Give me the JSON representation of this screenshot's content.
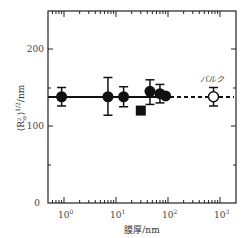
{
  "chart_data": {
    "type": "scatter",
    "title": "",
    "xlabel": "膜厚/nm",
    "ylabel": "⟨R²_zy⟩^(1/2)/nm",
    "xscale": "log",
    "xlim": [
      0.5,
      1800
    ],
    "ylim": [
      0,
      250
    ],
    "x_ticks": [
      "10^0",
      "10^1",
      "10^2",
      "10^3"
    ],
    "y_ticks": [
      "0",
      "100",
      "200"
    ],
    "grid": false,
    "series": [
      {
        "name": "thin films (circles)",
        "marker": "filled-circle",
        "points": [
          {
            "x": 0.9,
            "y": 138,
            "err_low": 126,
            "err_high": 150
          },
          {
            "x": 7,
            "y": 138,
            "err_low": 114,
            "err_high": 163
          },
          {
            "x": 14,
            "y": 138,
            "err_low": 125,
            "err_high": 151
          },
          {
            "x": 45,
            "y": 145,
            "err_low": 128,
            "err_high": 160
          },
          {
            "x": 70,
            "y": 142,
            "err_low": 130,
            "err_high": 154
          },
          {
            "x": 90,
            "y": 139
          }
        ]
      },
      {
        "name": "thin film (square)",
        "marker": "filled-square",
        "points": [
          {
            "x": 30,
            "y": 120
          }
        ]
      },
      {
        "name": "バルク",
        "marker": "open-circle",
        "points": [
          {
            "x": 750,
            "y": 138,
            "err_low": 126,
            "err_high": 150
          }
        ]
      }
    ],
    "reference_line": {
      "y": 138,
      "solid_range": [
        0.5,
        100
      ],
      "dashed_range": [
        100,
        1800
      ]
    },
    "annotations": [
      {
        "text": "バルク",
        "x": 750,
        "y": 160
      }
    ]
  },
  "labels": {
    "x_title": "膜厚/nm",
    "y_title_main": "⟨R",
    "y_title_sup": "2",
    "y_title_sub": "zy",
    "y_title_rest": "⟩",
    "y_title_exp": "1/2",
    "y_title_unit": "/nm",
    "bulk": "バルク",
    "y0": "0",
    "y100": "100",
    "y200": "200",
    "x0": "10",
    "x0e": "0",
    "x1": "10",
    "x1e": "1",
    "x2": "10",
    "x2e": "2",
    "x3": "10",
    "x3e": "3"
  }
}
